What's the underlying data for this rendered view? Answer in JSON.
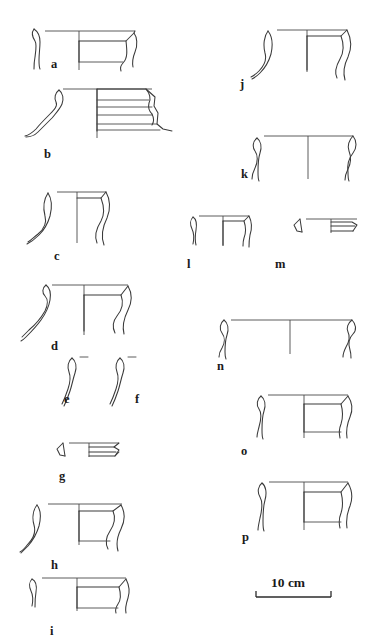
{
  "figure": {
    "type": "archaeological-pottery-profile-plate",
    "background_color": "#ffffff",
    "ink_color": "#3a3a3a",
    "width_px": 372,
    "height_px": 643,
    "columns": 2
  },
  "vessels": [
    {
      "id": "a",
      "label": "a",
      "label_x": 51,
      "label_y": 58,
      "column": "left",
      "description": "everted rim bowl profile with hatched section at left and vertical centreline"
    },
    {
      "id": "b",
      "label": "b",
      "label_x": 44,
      "label_y": 148,
      "column": "left",
      "description": "wavy S-shaped body sherd with stepped ridged rim and three horizontal grooves"
    },
    {
      "id": "c",
      "label": "c",
      "label_x": 54,
      "label_y": 250,
      "column": "left",
      "description": "flaring neck jar rim with concave curved wall"
    },
    {
      "id": "d",
      "label": "d",
      "label_x": 51,
      "label_y": 340,
      "column": "left",
      "description": "everted rim with thickened lip and flaring body"
    },
    {
      "id": "e",
      "label": "e",
      "label_x": 64,
      "label_y": 393,
      "column": "left",
      "description": "narrow curved neck section with measurement tick"
    },
    {
      "id": "f",
      "label": "f",
      "label_x": 135,
      "label_y": 393,
      "column": "left",
      "description": "narrow curved neck section with measurement tick"
    },
    {
      "id": "g",
      "label": "g",
      "label_x": 59,
      "label_y": 470,
      "column": "left",
      "description": "small flat grooved rim fragment"
    },
    {
      "id": "h",
      "label": "h",
      "label_x": 51,
      "label_y": 559,
      "column": "left",
      "description": "wide everted rim with strongly concave neck"
    },
    {
      "id": "i",
      "label": "i",
      "label_x": 50,
      "label_y": 630,
      "column": "left",
      "description": "shallow everted rim profile"
    },
    {
      "id": "j",
      "label": "j",
      "label_x": 240,
      "label_y": 78,
      "column": "right",
      "description": "everted rim jar with concave neck and flaring wall"
    },
    {
      "id": "k",
      "label": "k",
      "label_x": 241,
      "label_y": 168,
      "column": "right",
      "description": "simple rounded rim bowl with incurving wall"
    },
    {
      "id": "l",
      "label": "l",
      "label_x": 187,
      "label_y": 258,
      "column": "right",
      "description": "small plain rim fragment"
    },
    {
      "id": "m",
      "label": "m",
      "label_x": 275,
      "label_y": 258,
      "column": "right",
      "description": "small grooved flat rim fragment"
    },
    {
      "id": "n",
      "label": "n",
      "label_x": 217,
      "label_y": 360,
      "column": "right",
      "description": "wide shallow open bowl rim"
    },
    {
      "id": "o",
      "label": "o",
      "label_x": 241,
      "label_y": 445,
      "column": "right",
      "description": "everted rim bowl with short flaring lip"
    },
    {
      "id": "p",
      "label": "p",
      "label_x": 242,
      "label_y": 531,
      "column": "right",
      "description": "everted rim bowl with short flaring lip"
    }
  ],
  "scale_bar": {
    "label": "10 cm",
    "label_x": 271,
    "label_y": 576,
    "bar_left_x": 256,
    "bar_right_x": 331,
    "bar_y": 597,
    "tick_height": 6,
    "units": "cm",
    "length_value": 10
  }
}
